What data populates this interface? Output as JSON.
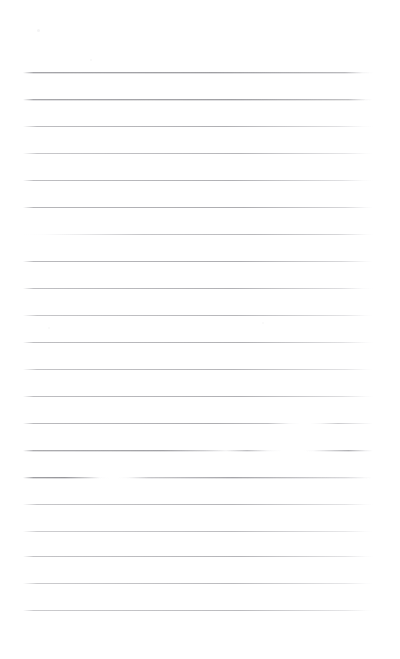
{
  "document": {
    "kind": "scanned-ruled-notepad-page",
    "title": "Blank Lined Page",
    "page_width": 400,
    "page_height": 659,
    "background_color": "#ffffff",
    "rule_color": "#9a9a9e",
    "rule_color_dark": "#6f6f74",
    "has_text_content": false,
    "visible_text": "",
    "margin_left": 23,
    "margin_right": 373,
    "first_rule_y": 72,
    "rule_spacing": 27,
    "rule_count": 21
  },
  "rules": [
    {
      "y": 72,
      "left": 23,
      "right": 373,
      "opacity": 0.7,
      "bleed": true,
      "gradient": "to right, rgba(154,154,158,0) 0%, rgba(120,120,126,0.95) 3%, rgba(120,120,126,1) 55%, rgba(140,140,146,0.85) 92%, rgba(200,200,205,0.25) 97%, rgba(255,255,255,0) 100%"
    },
    {
      "y": 99,
      "left": 23,
      "right": 373,
      "opacity": 0.7,
      "bleed": true,
      "gradient": "to right, rgba(154,154,158,0) 0%, rgba(120,120,126,0.92) 3%, rgba(120,120,126,1) 60%, rgba(145,145,150,0.8) 93%, rgba(205,205,210,0.2) 98%, rgba(255,255,255,0) 100%"
    },
    {
      "y": 126,
      "left": 23,
      "right": 373,
      "opacity": 0.62,
      "bleed": false,
      "gradient": "to right, rgba(154,154,158,0) 0%, rgba(130,130,136,0.85) 4%, rgba(128,128,134,1) 58%, rgba(170,170,176,0.6) 90%, rgba(215,215,220,0.2) 97%, rgba(255,255,255,0) 100%"
    },
    {
      "y": 153,
      "left": 23,
      "right": 373,
      "opacity": 0.58,
      "bleed": false,
      "gradient": "to right, rgba(154,154,158,0) 0%, rgba(135,135,141,0.8) 4%, rgba(130,130,136,1) 62%, rgba(175,175,181,0.55) 92%, rgba(220,220,225,0.18) 98%, rgba(255,255,255,0) 100%"
    },
    {
      "y": 180,
      "left": 23,
      "right": 373,
      "opacity": 0.6,
      "bleed": false,
      "gradient": "to right, rgba(154,154,158,0) 0%, rgba(128,128,134,0.85) 3%, rgba(126,126,132,1) 60%, rgba(168,168,174,0.6) 91%, rgba(214,214,219,0.2) 97%, rgba(255,255,255,0) 100%"
    },
    {
      "y": 207,
      "left": 23,
      "right": 373,
      "opacity": 0.62,
      "bleed": false,
      "gradient": "to right, rgba(154,154,158,0) 0%, rgba(124,124,130,0.9) 3%, rgba(122,122,128,1) 63%, rgba(160,160,166,0.7) 92%, rgba(210,210,215,0.25) 98%, rgba(255,255,255,0) 100%"
    },
    {
      "y": 234,
      "left": 23,
      "right": 373,
      "opacity": 0.55,
      "bleed": false,
      "gradient": "to right, rgba(255,255,255,0) 0%, rgba(225,225,230,0.15) 6%, rgba(185,185,191,0.5) 16%, rgba(140,140,146,0.9) 34%, rgba(128,128,134,1) 66%, rgba(155,155,161,0.75) 90%, rgba(215,215,220,0.2) 98%, rgba(255,255,255,0) 100%"
    },
    {
      "y": 261,
      "left": 23,
      "right": 373,
      "opacity": 0.62,
      "bleed": false,
      "gradient": "to right, rgba(154,154,158,0) 0%, rgba(126,126,132,0.88) 3%, rgba(124,124,130,1) 62%, rgba(160,160,166,0.68) 91%, rgba(212,212,217,0.22) 98%, rgba(255,255,255,0) 100%"
    },
    {
      "y": 288,
      "left": 23,
      "right": 373,
      "opacity": 0.6,
      "bleed": false,
      "gradient": "to right, rgba(154,154,158,0) 0%, rgba(130,130,136,0.85) 3%, rgba(126,126,132,1) 60%, rgba(165,165,171,0.62) 91%, rgba(214,214,219,0.2) 97%, rgba(255,255,255,0) 100%"
    },
    {
      "y": 315,
      "left": 23,
      "right": 373,
      "opacity": 0.58,
      "bleed": false,
      "gradient": "to right, rgba(154,154,158,0) 0%, rgba(134,134,140,0.82) 4%, rgba(130,130,136,1) 61%, rgba(172,172,178,0.58) 92%, rgba(218,218,223,0.18) 98%, rgba(255,255,255,0) 100%"
    },
    {
      "y": 342,
      "left": 23,
      "right": 373,
      "opacity": 0.6,
      "bleed": false,
      "gradient": "to right, rgba(154,154,158,0) 0%, rgba(128,128,134,0.86) 3%, rgba(126,126,132,1) 63%, rgba(166,166,172,0.6) 91%, rgba(215,215,220,0.2) 98%, rgba(255,255,255,0) 100%"
    },
    {
      "y": 369,
      "left": 23,
      "right": 373,
      "opacity": 0.58,
      "bleed": false,
      "gradient": "to right, rgba(154,154,158,0) 0%, rgba(132,132,138,0.84) 4%, rgba(128,128,134,1) 60%, rgba(170,170,176,0.58) 92%, rgba(216,216,221,0.18) 98%, rgba(255,255,255,0) 100%"
    },
    {
      "y": 396,
      "left": 23,
      "right": 373,
      "opacity": 0.6,
      "bleed": false,
      "gradient": "to right, rgba(154,154,158,0) 0%, rgba(128,128,134,0.86) 3%, rgba(124,124,130,1) 62%, rgba(162,162,168,0.62) 91%, rgba(213,213,218,0.2) 98%, rgba(255,255,255,0) 100%"
    },
    {
      "y": 423,
      "left": 23,
      "right": 373,
      "opacity": 0.62,
      "bleed": false,
      "gradient": "to right, rgba(154,154,158,0) 0%, rgba(128,128,134,0.88) 3%, rgba(124,124,130,1) 55%, rgba(140,140,146,0.9) 70%, rgba(205,205,210,0.25) 76%, rgba(255,255,255,0) 79%, rgba(255,255,255,0) 82%, rgba(205,205,210,0.3) 85%, rgba(150,150,156,0.8) 90%, rgba(190,190,196,0.35) 97%, rgba(255,255,255,0) 100%"
    },
    {
      "y": 450,
      "left": 23,
      "right": 373,
      "opacity": 0.66,
      "bleed": true,
      "gradient": "to right, rgba(154,154,158,0) 0%, rgba(118,118,124,0.92) 3%, rgba(116,116,122,1) 40%, rgba(150,150,156,0.7) 52%, rgba(200,200,205,0.3) 58%, rgba(140,140,146,0.85) 64%, rgba(205,205,210,0.25) 70%, rgba(255,255,255,0) 74%, rgba(255,255,255,0) 80%, rgba(215,215,220,0.2) 83%, rgba(160,160,166,0.7) 88%, rgba(130,130,136,0.95) 93%, rgba(190,190,196,0.35) 98%, rgba(255,255,255,0) 100%"
    },
    {
      "y": 477,
      "left": 23,
      "right": 373,
      "opacity": 0.7,
      "bleed": true,
      "gradient": "to right, rgba(154,154,158,0) 0%, rgba(110,110,116,0.95) 3%, rgba(108,108,114,1) 12%, rgba(150,150,156,0.7) 18%, rgba(225,225,230,0.15) 22%, rgba(255,255,255,0) 25%, rgba(255,255,255,0) 27%, rgba(215,215,220,0.2) 30%, rgba(150,150,156,0.75) 36%, rgba(128,128,134,1) 60%, rgba(165,165,171,0.6) 92%, rgba(215,215,220,0.2) 98%, rgba(255,255,255,0) 100%"
    },
    {
      "y": 504,
      "left": 23,
      "right": 373,
      "opacity": 0.58,
      "bleed": false,
      "gradient": "to right, rgba(154,154,158,0) 0%, rgba(134,134,140,0.82) 4%, rgba(130,130,136,1) 60%, rgba(172,172,178,0.58) 92%, rgba(218,218,223,0.18) 98%, rgba(255,255,255,0) 100%"
    },
    {
      "y": 531,
      "left": 23,
      "right": 373,
      "opacity": 0.55,
      "bleed": false,
      "gradient": "to right, rgba(154,154,158,0) 0%, rgba(138,138,144,0.78) 4%, rgba(134,134,140,1) 60%, rgba(176,176,182,0.55) 92%, rgba(220,220,225,0.16) 98%, rgba(255,255,255,0) 100%"
    },
    {
      "y": 556,
      "left": 23,
      "right": 373,
      "opacity": 0.58,
      "bleed": false,
      "gradient": "to right, rgba(154,154,158,0) 0%, rgba(132,132,138,0.84) 3%, rgba(128,128,134,1) 62%, rgba(170,170,176,0.58) 92%, rgba(217,217,222,0.18) 98%, rgba(255,255,255,0) 100%"
    },
    {
      "y": 583,
      "left": 23,
      "right": 373,
      "opacity": 0.55,
      "bleed": false,
      "gradient": "to right, rgba(154,154,158,0) 0%, rgba(136,136,142,0.8) 4%, rgba(132,132,138,1) 60%, rgba(174,174,180,0.55) 92%, rgba(219,219,224,0.16) 98%, rgba(255,255,255,0) 100%"
    },
    {
      "y": 610,
      "left": 23,
      "right": 373,
      "opacity": 0.55,
      "bleed": false,
      "gradient": "to right, rgba(154,154,158,0) 0%, rgba(136,136,142,0.8) 3%, rgba(132,132,138,1) 62%, rgba(172,172,178,0.56) 92%, rgba(219,219,224,0.16) 98%, rgba(255,255,255,0) 100%"
    }
  ],
  "specks": [
    {
      "x": 37,
      "y": 29,
      "size": 3,
      "color": "#f2f2f3",
      "opacity": 0.9
    },
    {
      "x": 90,
      "y": 59,
      "size": 2,
      "color": "#f5f5f6",
      "opacity": 0.8
    },
    {
      "x": 262,
      "y": 322,
      "size": 2,
      "color": "#f6f6f7",
      "opacity": 0.7
    },
    {
      "x": 48,
      "y": 327,
      "size": 2,
      "color": "#f6f6f7",
      "opacity": 0.7
    }
  ]
}
